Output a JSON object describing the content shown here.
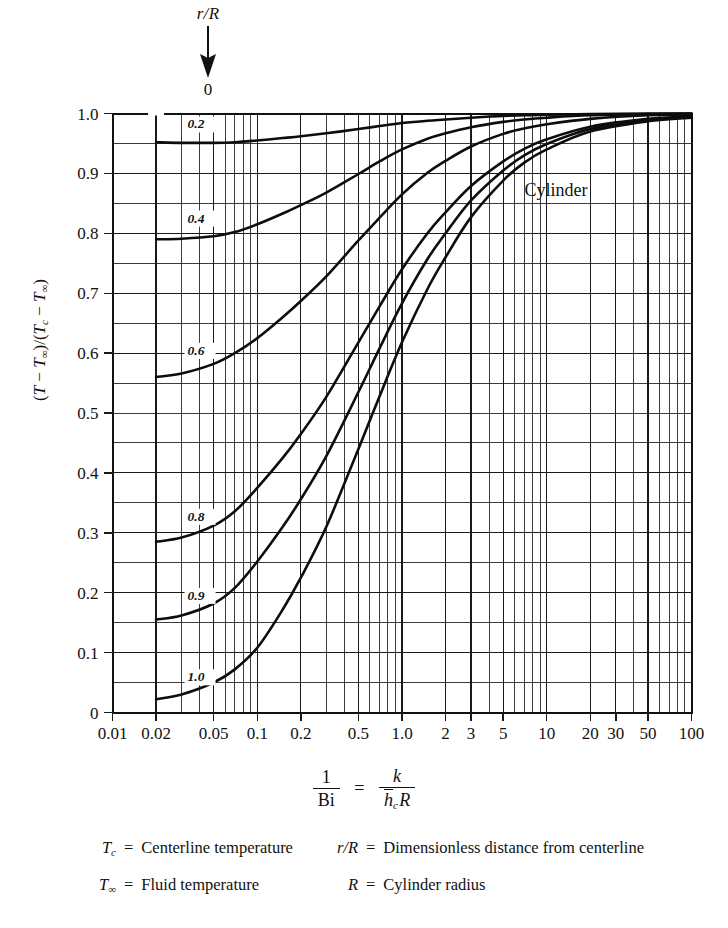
{
  "annotation": {
    "param_label": "r/R",
    "arrow_target_value": "0",
    "arrow_icon": "down-arrow-icon"
  },
  "plot": {
    "note_label": "Cylinder",
    "y_axis_title_parts": {
      "open": "(",
      "t": "T",
      "minus1": " − ",
      "tinf1": "T",
      "inf1": "∞",
      "close_over": ")/(",
      "tc": "T",
      "c": "c",
      "minus2": " − ",
      "tinf2": "T",
      "inf2": "∞",
      "close": ")"
    }
  },
  "formula": {
    "lhs_num": "1",
    "lhs_den": "Bi",
    "equals": "=",
    "rhs_num": "k",
    "rhs_den_h": "h",
    "rhs_den_h_sub": "c",
    "rhs_den_r": "R"
  },
  "legend": {
    "rows": [
      {
        "left_symbol": "T",
        "left_symbol_sub": "c",
        "left_equals": "=",
        "left_text": "Centerline temperature",
        "right_symbol": "r/R",
        "right_symbol_sub": "",
        "right_equals": "=",
        "right_text": "Dimensionless distance from centerline"
      },
      {
        "left_symbol": "T",
        "left_symbol_sub": "∞",
        "left_equals": "=",
        "left_text": "Fluid temperature",
        "right_symbol": "R",
        "right_symbol_sub": "",
        "right_equals": "=",
        "right_text": "Cylinder radius"
      }
    ]
  },
  "chart_data": {
    "type": "line",
    "title": "",
    "subtitle": "",
    "note": "Cylinder",
    "xlabel": "1/Bi = k/(h_c R)",
    "ylabel": "(T − T∞)/(Tc − T∞)",
    "xscale": "log",
    "yscale": "linear",
    "xlim": [
      0.01,
      100
    ],
    "ylim": [
      0,
      1.0
    ],
    "grid": true,
    "legend_position": "inline-curve-labels",
    "x_tick_labels": [
      "0.01",
      "0.02",
      "0.05",
      "0.1",
      "0.2",
      "0.5",
      "1.0",
      "2",
      "3",
      "5",
      "10",
      "20",
      "30",
      "50",
      "100"
    ],
    "x_tick_values": [
      0.01,
      0.02,
      0.05,
      0.1,
      0.2,
      0.5,
      1.0,
      2,
      3,
      5,
      10,
      20,
      30,
      50,
      100
    ],
    "y_tick_labels": [
      "0",
      "0.1",
      "0.2",
      "0.3",
      "0.4",
      "0.5",
      "0.6",
      "0.7",
      "0.8",
      "0.9",
      "1.0"
    ],
    "y_tick_values": [
      0,
      0.1,
      0.2,
      0.3,
      0.4,
      0.5,
      0.6,
      0.7,
      0.8,
      0.9,
      1.0
    ],
    "y_minor_step": 0.05,
    "series": [
      {
        "name": "0.2",
        "label": "0.2",
        "label_x": 0.033,
        "label_y": 0.975,
        "x": [
          0.02,
          0.03,
          0.05,
          0.07,
          0.1,
          0.15,
          0.2,
          0.3,
          0.5,
          0.7,
          1.0,
          1.5,
          2.0,
          3.0,
          5.0,
          7.0,
          10.0,
          20.0,
          50.0,
          100.0
        ],
        "y": [
          0.952,
          0.951,
          0.951,
          0.952,
          0.955,
          0.959,
          0.962,
          0.967,
          0.974,
          0.979,
          0.984,
          0.988,
          0.99,
          0.993,
          0.996,
          0.997,
          0.998,
          0.999,
          1.0,
          1.0
        ]
      },
      {
        "name": "0.4",
        "label": "0.4",
        "label_x": 0.033,
        "label_y": 0.818,
        "x": [
          0.02,
          0.03,
          0.05,
          0.07,
          0.1,
          0.15,
          0.2,
          0.3,
          0.5,
          0.7,
          1.0,
          1.5,
          2.0,
          3.0,
          5.0,
          7.0,
          10.0,
          20.0,
          50.0,
          100.0
        ],
        "y": [
          0.79,
          0.791,
          0.795,
          0.802,
          0.815,
          0.833,
          0.847,
          0.868,
          0.899,
          0.92,
          0.94,
          0.958,
          0.967,
          0.977,
          0.986,
          0.99,
          0.993,
          0.997,
          0.999,
          1.0
        ]
      },
      {
        "name": "0.6",
        "label": "0.6",
        "label_x": 0.033,
        "label_y": 0.597,
        "x": [
          0.02,
          0.03,
          0.05,
          0.07,
          0.1,
          0.15,
          0.2,
          0.3,
          0.5,
          0.7,
          1.0,
          1.5,
          2.0,
          3.0,
          5.0,
          7.0,
          10.0,
          20.0,
          50.0,
          100.0
        ],
        "y": [
          0.56,
          0.566,
          0.582,
          0.6,
          0.625,
          0.66,
          0.687,
          0.728,
          0.788,
          0.826,
          0.865,
          0.901,
          0.921,
          0.945,
          0.966,
          0.975,
          0.982,
          0.991,
          0.997,
          0.998
        ]
      },
      {
        "name": "0.8",
        "label": "0.8",
        "label_x": 0.033,
        "label_y": 0.32,
        "x": [
          0.02,
          0.03,
          0.05,
          0.07,
          0.1,
          0.15,
          0.2,
          0.3,
          0.5,
          0.7,
          1.0,
          1.5,
          2.0,
          3.0,
          5.0,
          7.0,
          10.0,
          20.0,
          50.0,
          100.0
        ],
        "y": [
          0.285,
          0.292,
          0.312,
          0.336,
          0.375,
          0.425,
          0.465,
          0.527,
          0.618,
          0.678,
          0.74,
          0.8,
          0.835,
          0.879,
          0.92,
          0.941,
          0.957,
          0.978,
          0.991,
          0.995
        ]
      },
      {
        "name": "0.9",
        "label": "0.9",
        "label_x": 0.033,
        "label_y": 0.188,
        "x": [
          0.02,
          0.03,
          0.05,
          0.07,
          0.1,
          0.15,
          0.2,
          0.3,
          0.5,
          0.7,
          1.0,
          1.5,
          2.0,
          3.0,
          5.0,
          7.0,
          10.0,
          20.0,
          50.0,
          100.0
        ],
        "y": [
          0.155,
          0.162,
          0.182,
          0.208,
          0.252,
          0.31,
          0.356,
          0.428,
          0.535,
          0.608,
          0.683,
          0.757,
          0.8,
          0.855,
          0.905,
          0.93,
          0.949,
          0.974,
          0.989,
          0.994
        ]
      },
      {
        "name": "1.0",
        "label": "1.0",
        "label_x": 0.033,
        "label_y": 0.052,
        "x": [
          0.02,
          0.03,
          0.05,
          0.07,
          0.1,
          0.15,
          0.2,
          0.3,
          0.5,
          0.7,
          1.0,
          1.5,
          2.0,
          3.0,
          5.0,
          7.0,
          10.0,
          20.0,
          50.0,
          100.0
        ],
        "y": [
          0.022,
          0.03,
          0.05,
          0.072,
          0.108,
          0.172,
          0.225,
          0.31,
          0.44,
          0.528,
          0.618,
          0.707,
          0.76,
          0.827,
          0.888,
          0.918,
          0.94,
          0.97,
          0.987,
          0.993
        ]
      }
    ]
  }
}
